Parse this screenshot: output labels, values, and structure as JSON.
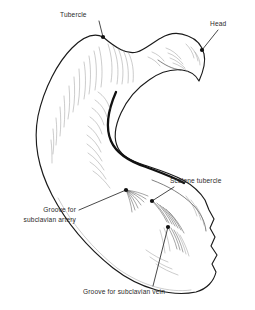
{
  "figure": {
    "view": "inferior surface",
    "background_color": "#ffffff",
    "ink_color": "#1a1a1a",
    "text_color": "#2a2a2a",
    "hatch_color": "#8d8d8d",
    "width": 255,
    "height": 310
  },
  "labels": [
    {
      "id": "tubercle",
      "name": "tubercle",
      "text": "Tubercle",
      "lines": [
        "Tubercle"
      ],
      "text_x": 60,
      "text_y": 17,
      "anchor": "start",
      "dot_x": 103,
      "dot_y": 37,
      "leader": "M 99,21 L 103,37"
    },
    {
      "id": "head",
      "name": "head",
      "text": "Head",
      "lines": [
        "Head"
      ],
      "text_x": 210,
      "text_y": 26,
      "anchor": "start",
      "dot_x": 202,
      "dot_y": 50,
      "leader": "M 218,30 L 202,50"
    },
    {
      "id": "scalene-tubercle",
      "name": "scalene-tubercle",
      "text": "Scalene tubercle",
      "lines": [
        "Scalene tubercle"
      ],
      "text_x": 170,
      "text_y": 183,
      "anchor": "start",
      "dot_x": 152,
      "dot_y": 201,
      "leader": "M 174,187 L 152,201"
    },
    {
      "id": "groove-subclavian-artery",
      "name": "groove-for-subclavian-artery",
      "text": "Groove for subclavian artery",
      "lines": [
        "Groove for",
        "subclavian artery"
      ],
      "text_x": 76,
      "text_y": 212,
      "anchor": "end",
      "dot_x": 126,
      "dot_y": 190,
      "leader": "M 79,210 L 126,190"
    },
    {
      "id": "groove-subclavian-vein",
      "name": "groove-for-subclavian-vein",
      "text": "Groove for subclavian vein",
      "lines": [
        "Groove for subclavian vein"
      ],
      "text_x": 83,
      "text_y": 294,
      "anchor": "start",
      "dot_x": 168,
      "dot_y": 227,
      "leader": "M 153,286 L 168,227"
    }
  ],
  "bone": {
    "name": "clavicle",
    "outline_path": "M 103,37 C 95,33 84,36 72,48 C 58,62 44,88 38,116 C 33,142 38,168 52,195 C 66,222 88,248 113,268 C 140,289 172,297 196,292 C 207,289 214,281 216,272 L 212,264 L 217,255 L 211,246 L 215,237 L 210,228 L 214,219 L 209,210 L 205,200 C 200,192 192,185 183,180 C 170,173 156,169 144,165 C 131,161 122,156 118,148 C 113,138 115,126 121,113 C 127,100 137,88 149,80 C 160,72 172,69 182,70 C 190,71 196,75 199,81 C 203,72 206,62 204,54 C 202,45 196,39 188,36 C 179,32 169,33 161,38 C 152,43 144,50 137,52 C 127,55 116,48 103,37 Z",
    "inner_arc_path": "M 112,96 C 106,111 104,128 110,141 C 116,154 130,161 145,166 C 158,171 172,176 183,182",
    "neck_path": "M 160,62 C 166,66 172,70 180,71",
    "sternal_edge_path": "M 205,200 C 200,192 192,185 183,180",
    "inferior_edge_path": "M 52,195 C 66,222 88,248 113,268 C 140,289 172,297 196,292"
  },
  "shading": {
    "description": "fine pen hatching on bone surface",
    "regions": [
      "superior-shaft",
      "head",
      "sternal-end",
      "subclavian-groove"
    ]
  }
}
